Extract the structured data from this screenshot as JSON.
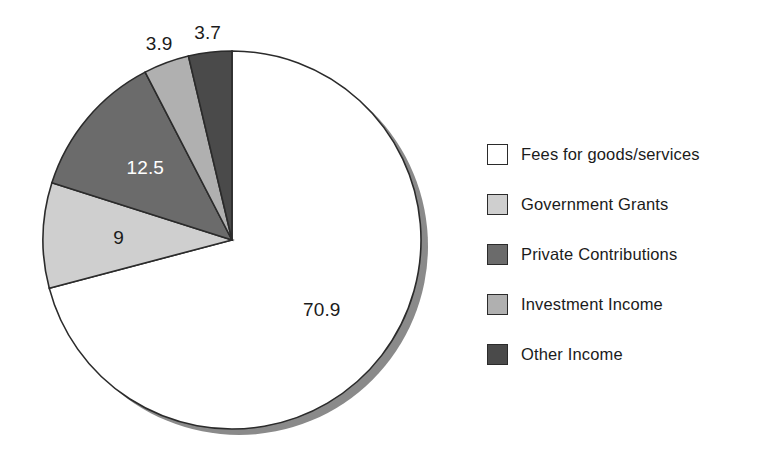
{
  "chart_data": {
    "type": "pie",
    "title": "",
    "subtitle": "",
    "xlabel": "",
    "ylabel": "",
    "grid": false,
    "legend_position": "right",
    "start_angle_deg": 90,
    "direction": "counterclockwise",
    "value_unit": "percent",
    "categories": [
      "Fees for goods/services",
      "Government Grants",
      "Private Contributions",
      "Investment Income",
      "Other Income"
    ],
    "values": [
      70.9,
      9,
      12.5,
      3.9,
      3.7
    ],
    "data_labels": [
      "70.9",
      "9",
      "12.5",
      "3.9",
      "3.7"
    ],
    "colors": [
      "#ffffff",
      "#cfcfcf",
      "#6b6b6b",
      "#b0b0b0",
      "#4a4a4a"
    ],
    "slices": [
      {
        "label": "Fees for goods/services",
        "value": 70.9,
        "display": "70.9",
        "color": "#ffffff",
        "label_color": "#1b1b1b",
        "label_inside": true
      },
      {
        "label": "Government Grants",
        "value": 9,
        "display": "9",
        "color": "#cfcfcf",
        "label_color": "#1b1b1b",
        "label_inside": true
      },
      {
        "label": "Private Contributions",
        "value": 12.5,
        "display": "12.5",
        "color": "#6b6b6b",
        "label_color": "#ffffff",
        "label_inside": true
      },
      {
        "label": "Investment Income",
        "value": 3.9,
        "display": "3.9",
        "color": "#b0b0b0",
        "label_color": "#1b1b1b",
        "label_inside": false
      },
      {
        "label": "Other Income",
        "value": 3.7,
        "display": "3.7",
        "color": "#4a4a4a",
        "label_color": "#1b1b1b",
        "label_inside": false
      }
    ]
  },
  "legend": {
    "items": [
      {
        "label": "Fees for goods/services",
        "color": "#ffffff"
      },
      {
        "label": "Government Grants",
        "color": "#cfcfcf"
      },
      {
        "label": "Private Contributions",
        "color": "#6b6b6b"
      },
      {
        "label": "Investment Income",
        "color": "#b0b0b0"
      },
      {
        "label": "Other Income",
        "color": "#4a4a4a"
      }
    ]
  },
  "style": {
    "outline": "#2b2b2b",
    "shadow": "#8a8a8a",
    "background": "#ffffff"
  }
}
